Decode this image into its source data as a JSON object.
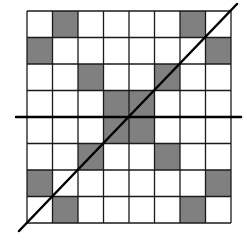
{
  "grid": {
    "rows": 8,
    "cols": 8,
    "left": 27,
    "top": 11,
    "right": 231,
    "bottom": 223,
    "fill_color": "#808080",
    "empty_color": "#ffffff",
    "line_color": "#1a1a1a",
    "shaded_cells": [
      [
        0,
        1
      ],
      [
        0,
        6
      ],
      [
        1,
        0
      ],
      [
        1,
        7
      ],
      [
        2,
        2
      ],
      [
        2,
        5
      ],
      [
        3,
        3
      ],
      [
        3,
        4
      ],
      [
        4,
        3
      ],
      [
        4,
        4
      ],
      [
        5,
        2
      ],
      [
        5,
        5
      ],
      [
        6,
        0
      ],
      [
        6,
        7
      ],
      [
        7,
        1
      ],
      [
        7,
        6
      ]
    ]
  },
  "lines": {
    "horizontal": {
      "x1": 16,
      "y1": 117,
      "x2": 241,
      "y2": 117
    },
    "diagonal": {
      "x1": 19,
      "y1": 231,
      "x2": 237,
      "y2": 4
    },
    "color": "#000000",
    "width": 2.5
  }
}
